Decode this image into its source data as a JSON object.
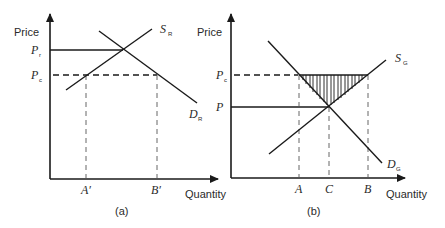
{
  "panel_a": {
    "caption": "(a)",
    "y_axis_label": "Price",
    "x_axis_label": "Quantity",
    "price_labels": {
      "upper": {
        "main": "P",
        "sub": "r"
      },
      "lower": {
        "main": "P",
        "sub": "c"
      }
    },
    "curves": {
      "supply": {
        "main": "S",
        "sub": "R"
      },
      "demand": {
        "main": "D",
        "sub": "R"
      }
    },
    "quantity_labels": [
      "A′",
      "B′"
    ]
  },
  "panel_b": {
    "caption": "(b)",
    "y_axis_label": "Price",
    "x_axis_label": "Quantity",
    "price_labels": {
      "upper": {
        "main": "P",
        "sub": "c"
      },
      "lower": {
        "main": "P",
        "sub": ""
      }
    },
    "curves": {
      "supply": {
        "main": "S",
        "sub": "G"
      },
      "demand": {
        "main": "D",
        "sub": "G"
      }
    },
    "quantity_labels": [
      "A",
      "C",
      "B"
    ]
  }
}
